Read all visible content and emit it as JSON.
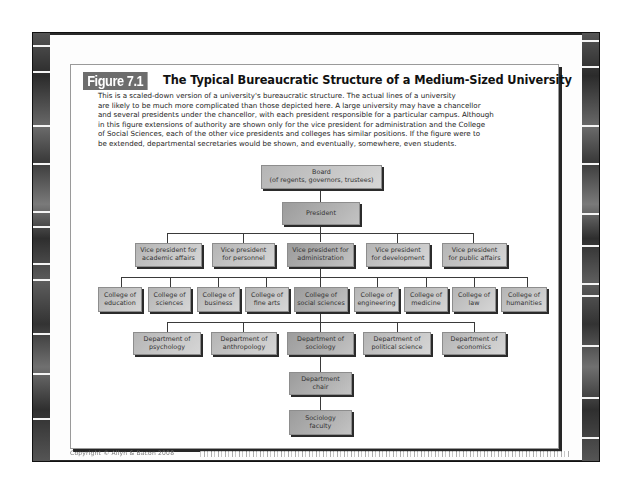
{
  "figure": {
    "label": "Figure 7.1",
    "title": "The Typical Bureaucratic Structure of a Medium-Sized University",
    "caption_lines": [
      "This is a scaled-down version of a university's bureaucratic structure. The actual lines of a university",
      "are likely to be much more complicated than those depicted here. A large university may have a chancellor",
      "and several presidents under the chancellor, with each president responsible for a particular campus. Although",
      "in this figure extensions of authority are shown only for the vice president for administration and the College",
      "of Social Sciences, each of the other vice presidents and colleges has similar positions. If the figure were to",
      "be extended, departmental secretaries would be shown, and eventually, somewhere, even students."
    ]
  },
  "org_chart": {
    "board": {
      "line1": "Board",
      "line2": "(of regents, governors, trustees)"
    },
    "president": "President",
    "vice_presidents": [
      {
        "line1": "Vice president for",
        "line2": "academic affairs"
      },
      {
        "line1": "Vice president",
        "line2": "for personnel"
      },
      {
        "line1": "Vice president for",
        "line2": "administration"
      },
      {
        "line1": "Vice president",
        "line2": "for development"
      },
      {
        "line1": "Vice president",
        "line2": "for public affairs"
      }
    ],
    "colleges": [
      {
        "line1": "College of",
        "line2": "education"
      },
      {
        "line1": "College of",
        "line2": "sciences"
      },
      {
        "line1": "College of",
        "line2": "business"
      },
      {
        "line1": "College of",
        "line2": "fine arts"
      },
      {
        "line1": "College of",
        "line2": "social sciences"
      },
      {
        "line1": "College of",
        "line2": "engineering"
      },
      {
        "line1": "College of",
        "line2": "medicine"
      },
      {
        "line1": "College of",
        "line2": "law"
      },
      {
        "line1": "College of",
        "line2": "humanities"
      }
    ],
    "departments": [
      {
        "line1": "Department of",
        "line2": "psychology"
      },
      {
        "line1": "Department of",
        "line2": "anthropology"
      },
      {
        "line1": "Department of",
        "line2": "sociology"
      },
      {
        "line1": "Department of",
        "line2": "political science"
      },
      {
        "line1": "Department of",
        "line2": "economics"
      }
    ],
    "department_chair": {
      "line1": "Department",
      "line2": "chair"
    },
    "faculty": {
      "line1": "Sociology",
      "line2": "faculty"
    }
  },
  "footer": {
    "copyright": "Copyright © Allyn & Bacon 2008"
  }
}
